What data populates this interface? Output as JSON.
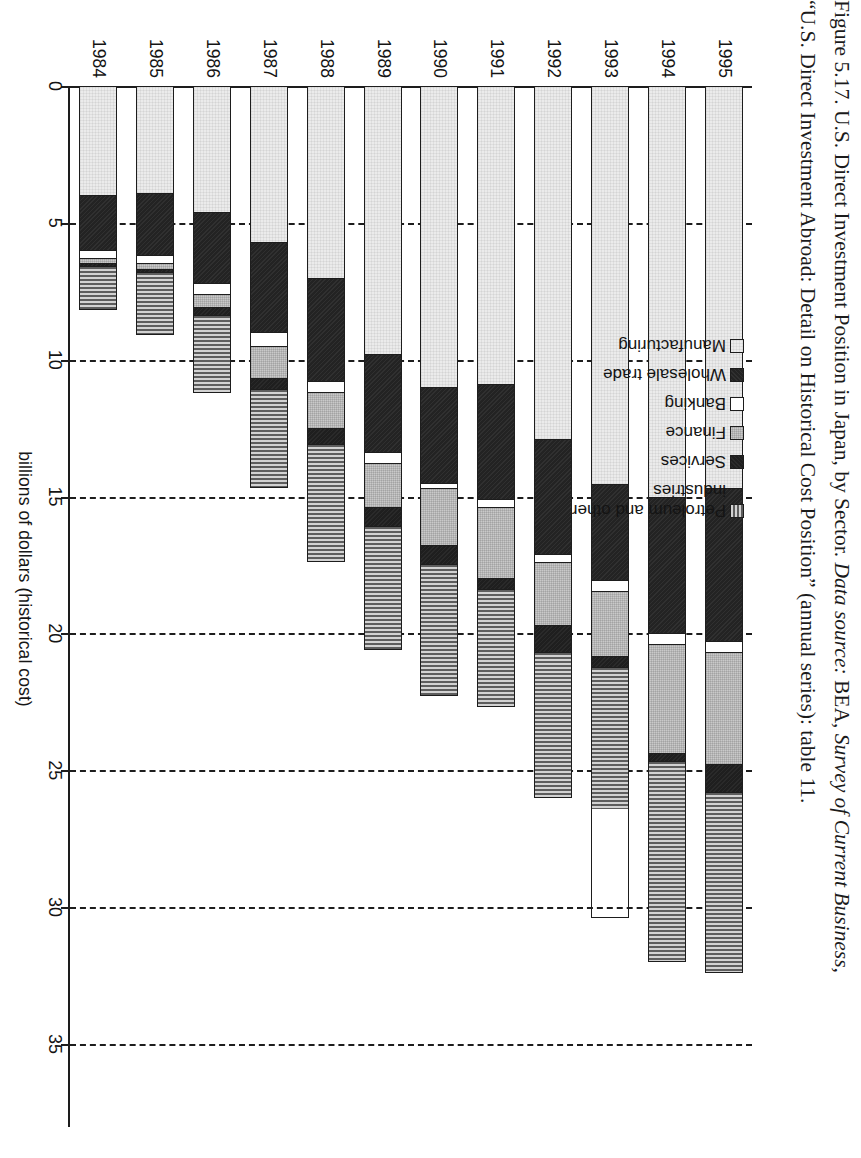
{
  "figure": {
    "caption_line1_plain_a": "Figure 5.17. U.S. Direct Investment Position in Japan, by Sector. ",
    "caption_line1_italic": "Data source:",
    "caption_line1_plain_b": " BEA, ",
    "caption_line1_italic2": "Survey of Current Business,",
    "caption_line2": "“U.S. Direct Investment Abroad: Detail on Historical Cost Position” (annual series): table 11."
  },
  "axis": {
    "value_axis_title": "billions of dollars (historical cost)",
    "value_ticks": [
      "0",
      "5",
      "10",
      "15",
      "20",
      "25",
      "30",
      "35"
    ],
    "value_tick_numbers": [
      0,
      5,
      10,
      15,
      20,
      25,
      30,
      35
    ],
    "value_min": 0,
    "value_max": 38,
    "category_axis_title": ""
  },
  "legend": {
    "position": "top-right",
    "items": [
      {
        "label": "Petroleum and other\nindustries",
        "key": "petroleum",
        "swatch": "vertical-stripe-gray"
      },
      {
        "label": "Services",
        "key": "services",
        "swatch": "solid-black"
      },
      {
        "label": "Finance",
        "key": "finance",
        "swatch": "light-gray"
      },
      {
        "label": "Banking",
        "key": "banking",
        "swatch": "white"
      },
      {
        "label": "Wholesale trade",
        "key": "wholesale",
        "swatch": "solid-black"
      },
      {
        "label": "Manufacturing",
        "key": "manufacturing",
        "swatch": "very-light-gray"
      }
    ]
  },
  "chart_data": {
    "type": "bar",
    "orientation": "horizontal-stacked",
    "title": "U.S. Direct Investment Position in Japan, by Sector",
    "xlabel": "billions of dollars (historical cost)",
    "ylabel": "",
    "xlim": [
      0,
      38
    ],
    "grid": "dashed vertical gridlines at every 5 units",
    "legend_position": "top right (rotated)",
    "categories": [
      "1984",
      "1985",
      "1986",
      "1987",
      "1988",
      "1989",
      "1990",
      "1991",
      "1992",
      "1993",
      "1994",
      "1995"
    ],
    "stack_order_from_axis": [
      "Manufacturing",
      "Wholesale trade",
      "Banking",
      "Finance",
      "Services",
      "Petroleum and other industries"
    ],
    "series": [
      {
        "name": "Manufacturing",
        "key": "manufacturing",
        "values": [
          4.0,
          3.9,
          4.6,
          5.7,
          7.0,
          9.8,
          11.0,
          10.9,
          12.9,
          14.5,
          15.0,
          14.7
        ]
      },
      {
        "name": "Wholesale trade",
        "key": "wholesale",
        "values": [
          2.0,
          2.3,
          2.6,
          3.3,
          3.8,
          3.6,
          3.5,
          4.2,
          4.2,
          3.5,
          5.0,
          5.6
        ]
      },
      {
        "name": "Banking",
        "key": "banking",
        "values": [
          0.3,
          0.3,
          0.4,
          0.5,
          0.4,
          0.4,
          0.2,
          0.3,
          0.3,
          0.4,
          0.4,
          0.4
        ]
      },
      {
        "name": "Finance",
        "key": "finance",
        "values": [
          0.2,
          0.2,
          0.5,
          1.2,
          1.3,
          1.6,
          2.1,
          2.6,
          2.3,
          2.4,
          4.0,
          4.1
        ]
      },
      {
        "name": "Services",
        "key": "services",
        "values": [
          0.1,
          0.1,
          0.3,
          0.4,
          0.6,
          0.7,
          0.7,
          0.4,
          1.0,
          0.4,
          0.3,
          1.0
        ]
      },
      {
        "name": "Petroleum and other industries",
        "key": "petroleum",
        "values": [
          1.6,
          2.3,
          2.8,
          3.6,
          4.3,
          4.5,
          4.8,
          4.3,
          5.3,
          5.2,
          7.3,
          6.6
        ]
      }
    ],
    "totals": [
      8.2,
      9.1,
      11.2,
      14.7,
      17.4,
      20.6,
      22.3,
      22.7,
      26.0,
      30.4,
      32.0,
      32.4
    ]
  },
  "colors": {
    "manufacturing": "#ebebeb",
    "wholesale": "#232323",
    "banking": "#ffffff",
    "finance": "#c9c9c9",
    "services": "#1f1f1f",
    "petroleum": "#9a9a9a",
    "ink": "#1d1d1d",
    "paper": "#ffffff"
  }
}
